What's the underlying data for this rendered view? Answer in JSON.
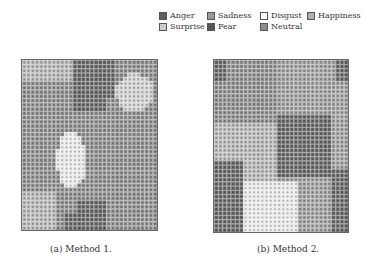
{
  "legend": [
    {
      "label": "Anger",
      "color": "#5e5e5e"
    },
    {
      "label": "Sadness",
      "color": "#9a9a9a"
    },
    {
      "label": "Disgust",
      "color": "#ffffff"
    },
    {
      "label": "Happiness",
      "color": "#b0b0b0"
    },
    {
      "label": "Surprise",
      "color": "#cdcdcd"
    },
    {
      "label": "Fear",
      "color": "#545454"
    },
    {
      "label": "Neutral",
      "color": "#8c8c8c"
    }
  ],
  "panels": [
    {
      "caption": "(a)  Method 1.",
      "regions": "method1"
    },
    {
      "caption": "(b)  Method 2.",
      "regions": "method2"
    }
  ]
}
